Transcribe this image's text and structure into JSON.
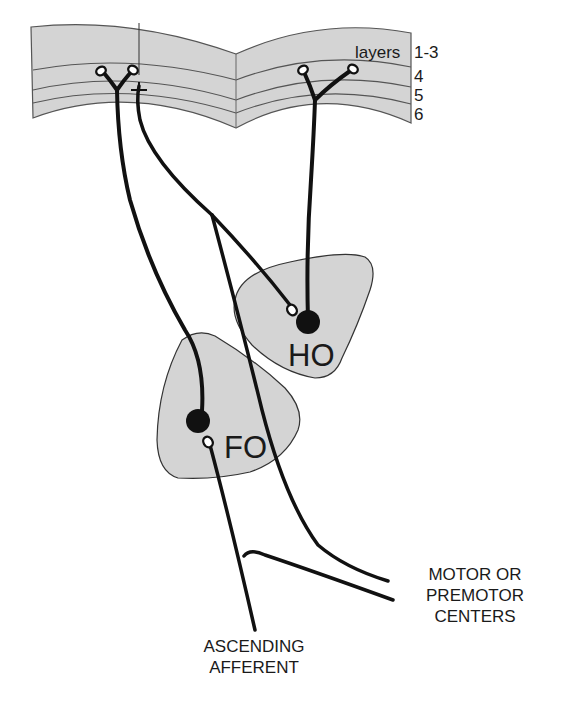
{
  "diagram": {
    "type": "neuroanatomy-circuit",
    "cortex": {
      "layer_labels": [
        "layers",
        "1-3",
        "4",
        "5",
        "6"
      ]
    },
    "nuclei": [
      {
        "id": "ho",
        "label": "HO"
      },
      {
        "id": "fo",
        "label": "FO"
      }
    ],
    "annotations": {
      "motor": [
        "MOTOR OR",
        "PREMOTOR",
        "CENTERS"
      ],
      "afferent": [
        "ASCENDING",
        "AFFERENT"
      ]
    },
    "colors": {
      "fill_gray": "#d4d4d4",
      "stroke": "#111111",
      "text": "#1a1a1a"
    }
  }
}
